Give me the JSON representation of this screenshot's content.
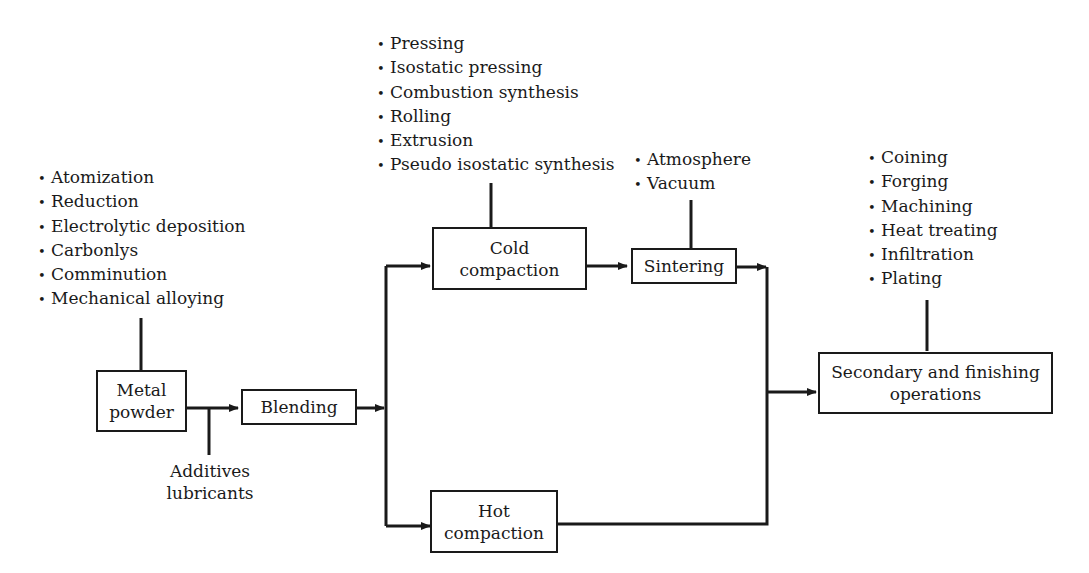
{
  "diagram": {
    "type": "process-flowchart",
    "nodes": {
      "metal_powder": {
        "line1": "Metal",
        "line2": "powder"
      },
      "blending": {
        "label": "Blending"
      },
      "cold_compaction": {
        "line1": "Cold",
        "line2": "compaction"
      },
      "sintering": {
        "label": "Sintering"
      },
      "hot_compaction": {
        "line1": "Hot",
        "line2": "compaction"
      },
      "secondary": {
        "line1": "Secondary and finishing",
        "line2": "operations"
      }
    },
    "inputs": {
      "additives": {
        "line1": "Additives",
        "line2": "lubricants"
      }
    },
    "lists": {
      "powder_methods": [
        "Atomization",
        "Reduction",
        "Electrolytic deposition",
        "Carbonlys",
        "Comminution",
        "Mechanical alloying"
      ],
      "compaction_methods": [
        "Pressing",
        "Isostatic pressing",
        "Combustion synthesis",
        "Rolling",
        "Extrusion",
        "Pseudo isostatic synthesis"
      ],
      "sintering_conditions": [
        "Atmosphere",
        "Vacuum"
      ],
      "finishing_methods": [
        "Coining",
        "Forging",
        "Machining",
        "Heat treating",
        "Infiltration",
        "Plating"
      ]
    },
    "edges": [
      [
        "Metal powder",
        "Blending"
      ],
      [
        "Additives lubricants",
        "Blending"
      ],
      [
        "Blending",
        "Cold compaction"
      ],
      [
        "Blending",
        "Hot compaction"
      ],
      [
        "Cold compaction",
        "Sintering"
      ],
      [
        "Sintering",
        "Secondary and finishing operations"
      ],
      [
        "Hot compaction",
        "Secondary and finishing operations"
      ]
    ],
    "colors": {
      "line": "#1a1a1a",
      "background": "#ffffff"
    }
  }
}
